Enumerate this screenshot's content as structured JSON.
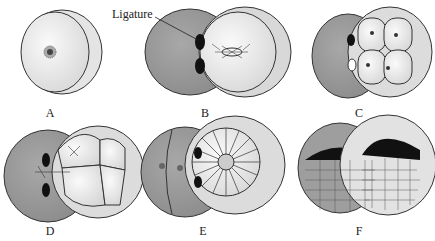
{
  "annotation": {
    "ligature": "Ligature"
  },
  "panels": [
    {
      "id": "A",
      "label": "A",
      "description": "Uncleaved egg with nucleus"
    },
    {
      "id": "B",
      "label": "B",
      "description": "Ligature separating halves; spindle in nucleated half"
    },
    {
      "id": "C",
      "label": "C",
      "description": "Four-cell stage on one side"
    },
    {
      "id": "D",
      "label": "D",
      "description": "Nucleus migrates across ligature"
    },
    {
      "id": "E",
      "label": "E",
      "description": "Both halves cleaving; multicellular half"
    },
    {
      "id": "F",
      "label": "F",
      "description": "Two embryos developing (blastula stage)"
    }
  ],
  "colors": {
    "shaded": "#9a9a9a",
    "light": "#eeeeee",
    "outline": "#333333",
    "dark": "#111111"
  }
}
